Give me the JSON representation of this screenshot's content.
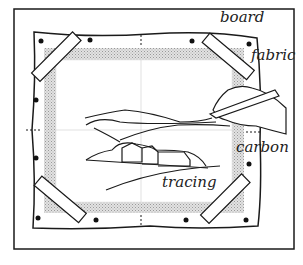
{
  "diagram": {
    "labels": {
      "board": "board",
      "fabric": "fabric",
      "carbon": "carbon",
      "tracing": "tracing"
    },
    "colors": {
      "ink": "#1a1a1a",
      "shading": "#bdbdbd",
      "background": "#ffffff"
    }
  }
}
